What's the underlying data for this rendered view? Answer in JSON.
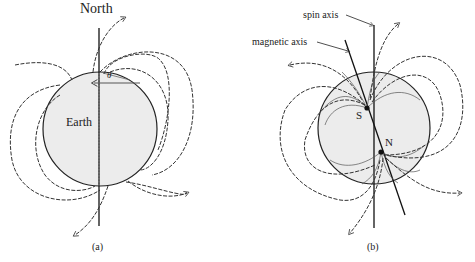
{
  "figure": {
    "panel_a": {
      "caption": "(a)",
      "north_label": "North",
      "body_label": "Earth",
      "angle_label": "θ",
      "fill_color": "#ececec"
    },
    "panel_b": {
      "caption": "(b)",
      "spin_axis_label": "spin axis",
      "magnetic_axis_label": "magnetic axis",
      "south_pole_label": "S",
      "north_pole_label": "N",
      "fill_color": "#ececec"
    }
  }
}
